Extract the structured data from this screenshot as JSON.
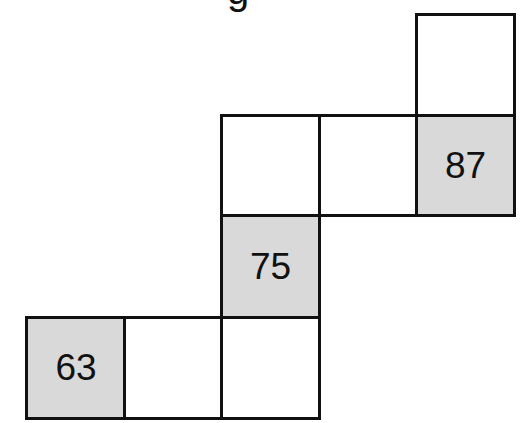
{
  "title_fragment": "g",
  "colors": {
    "shaded": "#d9d9d9",
    "border": "#111111",
    "blank": "#ffffff"
  },
  "cells": [
    {
      "row": 1,
      "col": 5,
      "value": "",
      "shaded": false
    },
    {
      "row": 2,
      "col": 3,
      "value": "",
      "shaded": false
    },
    {
      "row": 2,
      "col": 4,
      "value": "",
      "shaded": false
    },
    {
      "row": 2,
      "col": 5,
      "value": "87",
      "shaded": true
    },
    {
      "row": 3,
      "col": 3,
      "value": "75",
      "shaded": true
    },
    {
      "row": 4,
      "col": 1,
      "value": "63",
      "shaded": true
    },
    {
      "row": 4,
      "col": 2,
      "value": "",
      "shaded": false
    },
    {
      "row": 4,
      "col": 3,
      "value": "",
      "shaded": false
    }
  ]
}
